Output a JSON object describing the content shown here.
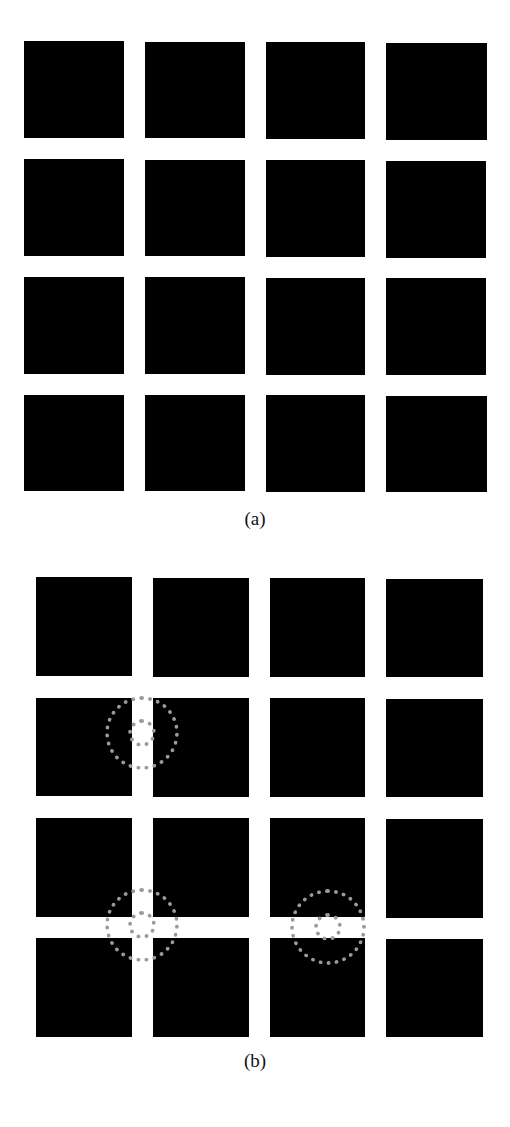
{
  "figure": {
    "panel_a": {
      "caption": "(a)",
      "squares": [
        {
          "x": 24,
          "y": 41,
          "w": 100,
          "h": 97
        },
        {
          "x": 145,
          "y": 42,
          "w": 100,
          "h": 96
        },
        {
          "x": 266,
          "y": 42,
          "w": 99,
          "h": 97
        },
        {
          "x": 386,
          "y": 43,
          "w": 101,
          "h": 97
        },
        {
          "x": 24,
          "y": 159,
          "w": 100,
          "h": 97
        },
        {
          "x": 145,
          "y": 160,
          "w": 100,
          "h": 96
        },
        {
          "x": 266,
          "y": 160,
          "w": 99,
          "h": 97
        },
        {
          "x": 386,
          "y": 161,
          "w": 100,
          "h": 97
        },
        {
          "x": 24,
          "y": 277,
          "w": 100,
          "h": 97
        },
        {
          "x": 145,
          "y": 277,
          "w": 100,
          "h": 97
        },
        {
          "x": 266,
          "y": 278,
          "w": 99,
          "h": 97
        },
        {
          "x": 386,
          "y": 278,
          "w": 100,
          "h": 97
        },
        {
          "x": 24,
          "y": 395,
          "w": 100,
          "h": 96
        },
        {
          "x": 145,
          "y": 395,
          "w": 100,
          "h": 96
        },
        {
          "x": 266,
          "y": 395,
          "w": 99,
          "h": 97
        },
        {
          "x": 386,
          "y": 396,
          "w": 101,
          "h": 96
        }
      ],
      "caption_y": 508
    },
    "panel_b": {
      "caption": "(b)",
      "squares": [
        {
          "x": 36,
          "y": 577,
          "w": 96,
          "h": 99
        },
        {
          "x": 153,
          "y": 578,
          "w": 96,
          "h": 99
        },
        {
          "x": 270,
          "y": 578,
          "w": 95,
          "h": 99
        },
        {
          "x": 386,
          "y": 579,
          "w": 97,
          "h": 98
        },
        {
          "x": 36,
          "y": 698,
          "w": 96,
          "h": 98
        },
        {
          "x": 153,
          "y": 698,
          "w": 96,
          "h": 99
        },
        {
          "x": 270,
          "y": 698,
          "w": 95,
          "h": 99
        },
        {
          "x": 386,
          "y": 699,
          "w": 97,
          "h": 98
        },
        {
          "x": 36,
          "y": 818,
          "w": 96,
          "h": 99
        },
        {
          "x": 153,
          "y": 818,
          "w": 96,
          "h": 99
        },
        {
          "x": 270,
          "y": 818,
          "w": 95,
          "h": 99
        },
        {
          "x": 386,
          "y": 819,
          "w": 97,
          "h": 99
        },
        {
          "x": 36,
          "y": 938,
          "w": 96,
          "h": 99
        },
        {
          "x": 153,
          "y": 938,
          "w": 96,
          "h": 99
        },
        {
          "x": 270,
          "y": 938,
          "w": 95,
          "h": 99
        },
        {
          "x": 386,
          "y": 939,
          "w": 97,
          "h": 98
        }
      ],
      "targets": [
        {
          "cx": 142,
          "cy": 733,
          "outer_r": 37,
          "inner_r": 14
        },
        {
          "cx": 142,
          "cy": 925,
          "outer_r": 37,
          "inner_r": 14
        },
        {
          "cx": 328,
          "cy": 927,
          "outer_r": 38,
          "inner_r": 14
        }
      ],
      "ring_color": "#9a9a9a",
      "caption_y": 1050
    }
  }
}
